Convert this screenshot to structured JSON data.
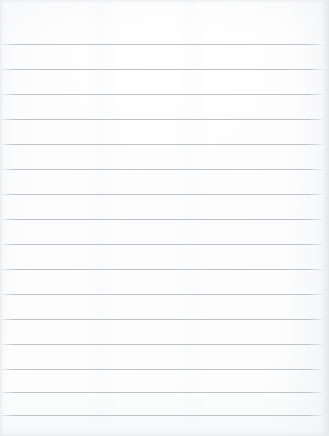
{
  "document": {
    "type": "scanned-ruled-notebook-page",
    "title": "Blank lined paper",
    "orientation": "portrait",
    "page_width_px": 329,
    "page_height_px": 436,
    "paper_color": "#fdfdfd",
    "rule_color": "#b9bdc2",
    "rule_thickness_px": 1,
    "rule_spacing_px": 25,
    "first_rule_y_px": 44,
    "last_rule_y_px": 415,
    "rule_count": 16,
    "left_margin_px": 0,
    "right_margin_px": 7,
    "top_margin_px": 44,
    "bottom_margin_px": 21,
    "has_vertical_margin_rule": false,
    "has_handwriting": false,
    "has_printed_text": false,
    "visible_text": ""
  },
  "rules": [
    {
      "index": 1,
      "y": 44,
      "left": 0,
      "right": 7,
      "opacity": 0.88
    },
    {
      "index": 2,
      "y": 69,
      "left": 0,
      "right": 7,
      "opacity": 0.92
    },
    {
      "index": 3,
      "y": 94,
      "left": 0,
      "right": 7,
      "opacity": 0.9
    },
    {
      "index": 4,
      "y": 119,
      "left": 0,
      "right": 7,
      "opacity": 0.93
    },
    {
      "index": 5,
      "y": 144,
      "left": 0,
      "right": 7,
      "opacity": 0.9
    },
    {
      "index": 6,
      "y": 169,
      "left": 0,
      "right": 7,
      "opacity": 0.92
    },
    {
      "index": 7,
      "y": 194,
      "left": 0,
      "right": 7,
      "opacity": 0.88
    },
    {
      "index": 8,
      "y": 219,
      "left": 0,
      "right": 7,
      "opacity": 0.93
    },
    {
      "index": 9,
      "y": 244,
      "left": 0,
      "right": 7,
      "opacity": 0.9
    },
    {
      "index": 10,
      "y": 269,
      "left": 0,
      "right": 7,
      "opacity": 0.92
    },
    {
      "index": 11,
      "y": 294,
      "left": 0,
      "right": 7,
      "opacity": 0.9
    },
    {
      "index": 12,
      "y": 319,
      "left": 0,
      "right": 7,
      "opacity": 0.93
    },
    {
      "index": 13,
      "y": 344,
      "left": 0,
      "right": 7,
      "opacity": 0.9
    },
    {
      "index": 14,
      "y": 369,
      "left": 0,
      "right": 7,
      "opacity": 0.92
    },
    {
      "index": 15,
      "y": 392,
      "left": 0,
      "right": 7,
      "opacity": 0.88
    },
    {
      "index": 16,
      "y": 415,
      "left": 0,
      "right": 7,
      "opacity": 0.9
    }
  ],
  "writing_rows": [
    {
      "index": 1,
      "top": 45,
      "height": 24,
      "content": ""
    },
    {
      "index": 2,
      "top": 70,
      "height": 24,
      "content": ""
    },
    {
      "index": 3,
      "top": 95,
      "height": 24,
      "content": ""
    },
    {
      "index": 4,
      "top": 120,
      "height": 24,
      "content": ""
    },
    {
      "index": 5,
      "top": 145,
      "height": 24,
      "content": ""
    },
    {
      "index": 6,
      "top": 170,
      "height": 24,
      "content": ""
    },
    {
      "index": 7,
      "top": 195,
      "height": 24,
      "content": ""
    },
    {
      "index": 8,
      "top": 220,
      "height": 24,
      "content": ""
    },
    {
      "index": 9,
      "top": 245,
      "height": 24,
      "content": ""
    },
    {
      "index": 10,
      "top": 270,
      "height": 24,
      "content": ""
    },
    {
      "index": 11,
      "top": 295,
      "height": 24,
      "content": ""
    },
    {
      "index": 12,
      "top": 320,
      "height": 24,
      "content": ""
    },
    {
      "index": 13,
      "top": 345,
      "height": 24,
      "content": ""
    },
    {
      "index": 14,
      "top": 370,
      "height": 22,
      "content": ""
    },
    {
      "index": 15,
      "top": 393,
      "height": 22,
      "content": ""
    }
  ],
  "margins": {
    "top_area": {
      "top": 0,
      "height": 44,
      "content": ""
    },
    "bottom_area": {
      "top": 416,
      "height": 20,
      "content": ""
    }
  }
}
